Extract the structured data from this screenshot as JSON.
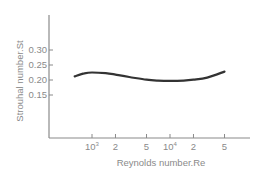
{
  "chart_data": {
    "type": "line",
    "title": "",
    "xlabel": "Reynolds number.Re",
    "ylabel": "Strouhal number.St",
    "x_scale": "log",
    "x_ticks": [
      {
        "value": 1000,
        "label_base": "10",
        "label_sup": "3"
      },
      {
        "value": 2000,
        "label_base": "2",
        "label_sup": ""
      },
      {
        "value": 5000,
        "label_base": "5",
        "label_sup": ""
      },
      {
        "value": 10000,
        "label_base": "10",
        "label_sup": "4"
      },
      {
        "value": 20000,
        "label_base": "2",
        "label_sup": ""
      },
      {
        "value": 50000,
        "label_base": "5",
        "label_sup": ""
      }
    ],
    "y_ticks": [
      "0.30",
      "0.25",
      "0.20",
      "0.15"
    ],
    "ylim": [
      0.0,
      0.35
    ],
    "grid": false,
    "legend": null,
    "series": [
      {
        "name": "St vs Re",
        "x": [
          600,
          800,
          1000,
          1500,
          2000,
          3000,
          5000,
          7000,
          10000,
          15000,
          20000,
          30000,
          50000
        ],
        "y": [
          0.212,
          0.222,
          0.225,
          0.223,
          0.218,
          0.21,
          0.201,
          0.198,
          0.197,
          0.198,
          0.201,
          0.208,
          0.228
        ]
      }
    ]
  },
  "colors": {
    "axis": "#8a8a8a",
    "curve": "#333333",
    "text": "#8a8a8a"
  }
}
